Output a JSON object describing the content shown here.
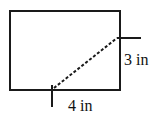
{
  "diagram": {
    "shape": "rectangle",
    "dashed_segment": {
      "description": "dashed line from bottom-edge mark to right-edge mark"
    },
    "labels": {
      "horizontal": "4 in",
      "vertical": "3 in"
    },
    "colors": {
      "stroke": "#1a1a1a",
      "background": "#ffffff"
    }
  }
}
